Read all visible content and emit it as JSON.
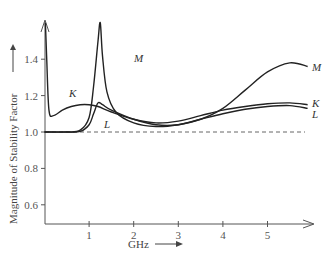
{
  "chart_data": {
    "type": "line",
    "title": "",
    "xlabel": "GHz",
    "ylabel": "Magnitude of Stability Factor",
    "xlim": [
      0,
      6
    ],
    "ylim": [
      0.5,
      1.6
    ],
    "grid": false,
    "legend": "inline curve labels",
    "x_ticks": [
      "1",
      "2",
      "3",
      "4",
      "5"
    ],
    "y_ticks": [
      "0.6",
      "0.8",
      "1.0",
      "1.2",
      "1.4"
    ],
    "reference_line": {
      "y": 1.0,
      "style": "dashed"
    },
    "series": [
      {
        "name": "K",
        "x": [
          0.02,
          0.05,
          0.1,
          0.2,
          0.4,
          0.6,
          0.8,
          1.0,
          1.2,
          1.5,
          2.0,
          2.5,
          3.0,
          3.5,
          4.0,
          4.5,
          5.0,
          5.5,
          5.9
        ],
        "values": [
          1.6,
          1.4,
          1.12,
          1.09,
          1.12,
          1.14,
          1.15,
          1.15,
          1.14,
          1.11,
          1.07,
          1.05,
          1.06,
          1.09,
          1.12,
          1.14,
          1.155,
          1.16,
          1.15
        ]
      },
      {
        "name": "L",
        "x": [
          0.0,
          0.5,
          0.8,
          1.0,
          1.1,
          1.2,
          1.3,
          1.5,
          2.0,
          2.5,
          3.0,
          3.5,
          4.0,
          4.5,
          5.0,
          5.5,
          5.9
        ],
        "values": [
          1.0,
          1.0,
          1.003,
          1.04,
          1.1,
          1.16,
          1.15,
          1.12,
          1.07,
          1.04,
          1.04,
          1.07,
          1.1,
          1.125,
          1.14,
          1.145,
          1.13
        ]
      },
      {
        "name": "M",
        "x": [
          0.0,
          0.5,
          0.8,
          1.0,
          1.1,
          1.2,
          1.25,
          1.3,
          1.4,
          1.6,
          2.0,
          2.5,
          3.0,
          3.5,
          4.0,
          4.5,
          5.0,
          5.5,
          5.9
        ],
        "values": [
          1.0,
          1.0,
          1.01,
          1.08,
          1.25,
          1.5,
          1.6,
          1.42,
          1.22,
          1.11,
          1.05,
          1.03,
          1.04,
          1.07,
          1.13,
          1.23,
          1.33,
          1.38,
          1.36
        ]
      }
    ]
  },
  "labels": {
    "y_axis_title": "Magnitude of Stability Factor",
    "x_axis_title": "GHz",
    "curve_K": "K",
    "curve_L": "L",
    "curve_M": "M"
  }
}
